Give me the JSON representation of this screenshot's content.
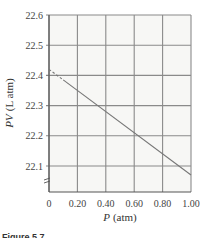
{
  "chart_data": {
    "type": "line",
    "title": "",
    "xlabel": "P (atm)",
    "xlabel_italic": "P",
    "xlabel_unit": "(atm)",
    "ylabel": "PV (L atm)",
    "ylabel_italic": "PV",
    "ylabel_unit": "(L atm)",
    "xlim": [
      0,
      1.0
    ],
    "ylim": [
      22.05,
      22.6
    ],
    "x_ticks": [
      "0",
      "0.20",
      "0.40",
      "0.60",
      "0.80",
      "1.00"
    ],
    "x_tick_values": [
      0,
      0.2,
      0.4,
      0.6,
      0.8,
      1.0
    ],
    "y_ticks": [
      "22.1",
      "22.2",
      "22.3",
      "22.4",
      "22.5",
      "22.6"
    ],
    "y_tick_values": [
      22.1,
      22.2,
      22.3,
      22.4,
      22.5,
      22.6
    ],
    "grid": true,
    "axis_break": "y-axis break symbol below 22.1",
    "series": [
      {
        "name": "extrapolation",
        "style": "dashed",
        "x": [
          0.0,
          0.1
        ],
        "y": [
          22.42,
          22.385
        ]
      },
      {
        "name": "measured",
        "style": "solid",
        "x": [
          0.1,
          1.0
        ],
        "y": [
          22.385,
          22.07
        ]
      }
    ]
  },
  "caption": {
    "text": "Figure 5.7"
  }
}
